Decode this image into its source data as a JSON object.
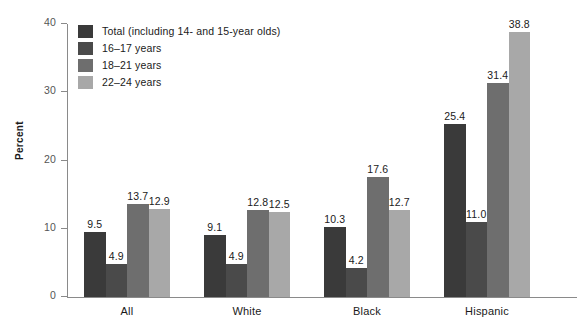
{
  "chart_data": {
    "type": "bar",
    "title": "",
    "xlabel": "",
    "ylabel": "Percent",
    "ylim": [
      0,
      40
    ],
    "yticks": [
      0,
      10,
      20,
      30,
      40
    ],
    "grid": false,
    "legend_position": "top-left",
    "categories": [
      "All",
      "White",
      "Black",
      "Hispanic"
    ],
    "series": [
      {
        "name": "Total (including 14- and 15-year olds)",
        "color": "#3a3a3a",
        "values": [
          9.5,
          9.1,
          10.3,
          25.4
        ],
        "labels": [
          "9.5",
          "9.1",
          "10.3",
          "25.4"
        ]
      },
      {
        "name": "16–17 years",
        "color": "#4a4a4a",
        "values": [
          4.9,
          4.9,
          4.2,
          11.0
        ],
        "labels": [
          "4.9",
          "4.9",
          "4.2",
          "11.0"
        ]
      },
      {
        "name": "18–21 years",
        "color": "#6e6e6e",
        "values": [
          13.7,
          12.8,
          17.6,
          31.4
        ],
        "labels": [
          "13.7",
          "12.8",
          "17.6",
          "31.4"
        ]
      },
      {
        "name": "22–24 years",
        "color": "#a8a8a8",
        "values": [
          12.9,
          12.5,
          12.7,
          38.8
        ],
        "labels": [
          "12.9",
          "12.5",
          "12.7",
          "38.8"
        ]
      }
    ]
  },
  "axis": {
    "y_tick_labels": [
      "0",
      "10",
      "20",
      "30",
      "40"
    ],
    "y_title": "Percent"
  },
  "legend": {
    "items": [
      {
        "label": "Total (including 14- and 15-year olds)",
        "color": "#3a3a3a"
      },
      {
        "label": "16–17 years",
        "color": "#4a4a4a"
      },
      {
        "label": "18–21 years",
        "color": "#6e6e6e"
      },
      {
        "label": "22–24 years",
        "color": "#a8a8a8"
      }
    ]
  },
  "colors": {
    "axis": "#8a8a8a",
    "text": "#1a1a1a",
    "tick_text": "#555555",
    "background": "#ffffff"
  }
}
